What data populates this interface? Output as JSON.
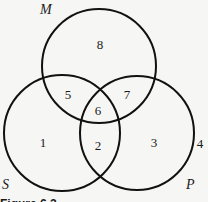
{
  "diagram": {
    "type": "venn",
    "sets": [
      {
        "name": "M",
        "cx": 99,
        "cy": 66,
        "r": 57,
        "label_x": 40,
        "label_y": 14
      },
      {
        "name": "S",
        "cx": 62,
        "cy": 133,
        "r": 58,
        "label_x": 2,
        "label_y": 189
      },
      {
        "name": "P",
        "cx": 137,
        "cy": 133,
        "r": 57,
        "label_x": 186,
        "label_y": 189
      }
    ],
    "regions": [
      {
        "number": "8",
        "desc": "M only",
        "x": 100,
        "y": 49
      },
      {
        "number": "5",
        "desc": "M and S only",
        "x": 68,
        "y": 99
      },
      {
        "number": "7",
        "desc": "M and P only",
        "x": 127,
        "y": 99
      },
      {
        "number": "6",
        "desc": "M, S and P",
        "x": 98,
        "y": 115
      },
      {
        "number": "1",
        "desc": "S only",
        "x": 43,
        "y": 147
      },
      {
        "number": "2",
        "desc": "S and P only",
        "x": 98,
        "y": 150
      },
      {
        "number": "3",
        "desc": "P only",
        "x": 154,
        "y": 147
      },
      {
        "number": "4",
        "desc": "outside all",
        "x": 200,
        "y": 148
      }
    ],
    "caption": "Figure 6.2"
  }
}
